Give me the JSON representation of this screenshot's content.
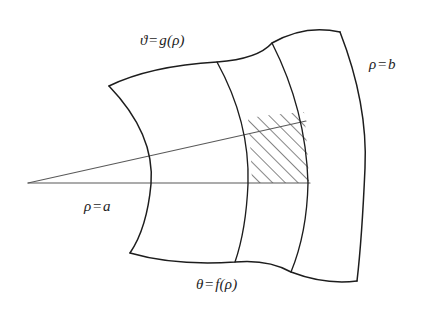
{
  "figure": {
    "kind": "polar-region-diagram",
    "background_color": "#ffffff",
    "stroke_color": "#1d1d1d",
    "hatch_color": "#2b2b2b",
    "ray_color": "#4a4a4a",
    "labels": {
      "upper_curve": {
        "lhs": "ϑ",
        "op": "=",
        "rhs": "g(ρ)",
        "text": "ϑ = g(ρ)"
      },
      "outer_arc": {
        "lhs": "ρ",
        "op": "=",
        "rhs": "b",
        "text": "ρ = b"
      },
      "inner_arc": {
        "lhs": "ρ",
        "op": "=",
        "rhs": "a",
        "text": "ρ = a"
      },
      "lower_curve": {
        "lhs": "θ",
        "op": "=",
        "rhs": "f(ρ)",
        "text": "θ = f(ρ)"
      }
    },
    "geometry": {
      "apex": [
        28,
        183
      ],
      "rays": [
        {
          "name": "horizontal-ray",
          "from": [
            28,
            183
          ],
          "to": [
            310,
            183
          ]
        },
        {
          "name": "slanted-ray",
          "from": [
            28,
            183
          ],
          "to": [
            306,
            121
          ]
        }
      ],
      "inner_arc_rho_a": "M 109 86 Q 155 134 151 184 Q 147 228 130 253",
      "outer_arc_rho_b": "M 340 32 Q 368 104 365 168 Q 362 238 357 281",
      "arc_1": "M 217 62 Q 250 122 248 184 Q 246 230 235 262",
      "arc_2": "M 272 43 Q 306 110 308 183 Q 307 233 291 272",
      "upper_curve_g": "M 109 86 Q 150 66 217 62 Q 258 59 272 43 Q 305 24 340 32",
      "lower_curve_f": "M 130 253 Q 175 266 235 262 Q 268 259 291 272 Q 325 285 357 281",
      "hatch_cell": {
        "corners": [
          [
            248,
            118
          ],
          [
            304,
            112
          ],
          [
            309,
            183
          ],
          [
            252,
            183
          ]
        ],
        "left_edge": "M 248 118 Q 251 152 252 183",
        "right_edge": "M 304 112 Q 308 150 309 183"
      }
    }
  }
}
